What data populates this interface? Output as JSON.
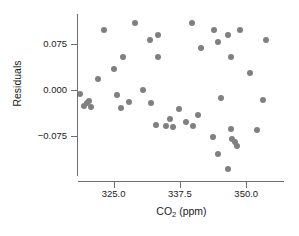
{
  "chart_data": {
    "type": "scatter",
    "title": "",
    "xlabel": "CO2 (ppm)",
    "xlabel_parts": {
      "prefix": "CO",
      "subscript": "2",
      "suffix": " (ppm)"
    },
    "ylabel": "Residuals",
    "xlim": [
      318.3,
      357.3
    ],
    "ylim": [
      -0.14,
      0.125
    ],
    "xticks": [
      325.0,
      337.5,
      350.0,
      362.5
    ],
    "xtick_labels": [
      "325.0",
      "337.5",
      "350.0",
      ""
    ],
    "yticks": [
      0.075,
      0.0,
      -0.075
    ],
    "ytick_labels": [
      "0.075",
      "0.000",
      "−0.075"
    ],
    "grid": false,
    "legend": false,
    "marker_color": "#808080",
    "axis_color": "#6e6e6e",
    "background": "#ffffff",
    "n_points": 45,
    "points": [
      {
        "x": 329.1,
        "y": 0.111
      },
      {
        "x": 339.7,
        "y": 0.111
      },
      {
        "x": 323.2,
        "y": 0.099
      },
      {
        "x": 343.9,
        "y": 0.099
      },
      {
        "x": 348.9,
        "y": 0.099
      },
      {
        "x": 333.3,
        "y": 0.091
      },
      {
        "x": 346.5,
        "y": 0.091
      },
      {
        "x": 331.8,
        "y": 0.083
      },
      {
        "x": 353.8,
        "y": 0.083
      },
      {
        "x": 344.6,
        "y": 0.079
      },
      {
        "x": 341.5,
        "y": 0.069
      },
      {
        "x": 326.7,
        "y": 0.054
      },
      {
        "x": 333.3,
        "y": 0.054
      },
      {
        "x": 347.2,
        "y": 0.054
      },
      {
        "x": 325.0,
        "y": 0.034
      },
      {
        "x": 350.7,
        "y": 0.028
      },
      {
        "x": 322.0,
        "y": 0.018
      },
      {
        "x": 330.6,
        "y": 0.0
      },
      {
        "x": 318.7,
        "y": -0.006
      },
      {
        "x": 325.6,
        "y": -0.008
      },
      {
        "x": 345.3,
        "y": -0.014
      },
      {
        "x": 353.1,
        "y": -0.016
      },
      {
        "x": 320.4,
        "y": -0.018
      },
      {
        "x": 327.9,
        "y": -0.02
      },
      {
        "x": 320.0,
        "y": -0.022
      },
      {
        "x": 332.0,
        "y": -0.022
      },
      {
        "x": 319.5,
        "y": -0.026
      },
      {
        "x": 320.8,
        "y": -0.028
      },
      {
        "x": 326.4,
        "y": -0.03
      },
      {
        "x": 337.4,
        "y": -0.032
      },
      {
        "x": 341.0,
        "y": -0.042
      },
      {
        "x": 335.7,
        "y": -0.048
      },
      {
        "x": 338.6,
        "y": -0.052
      },
      {
        "x": 333.0,
        "y": -0.057
      },
      {
        "x": 334.8,
        "y": -0.059
      },
      {
        "x": 340.0,
        "y": -0.06
      },
      {
        "x": 336.2,
        "y": -0.061
      },
      {
        "x": 347.2,
        "y": -0.064
      },
      {
        "x": 352.0,
        "y": -0.066
      },
      {
        "x": 343.7,
        "y": -0.077
      },
      {
        "x": 347.4,
        "y": -0.08
      },
      {
        "x": 347.8,
        "y": -0.086
      },
      {
        "x": 348.3,
        "y": -0.092
      },
      {
        "x": 344.6,
        "y": -0.106
      },
      {
        "x": 346.5,
        "y": -0.13
      }
    ]
  }
}
